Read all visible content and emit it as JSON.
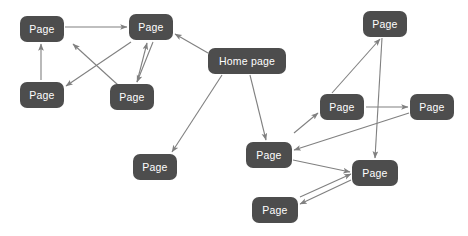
{
  "diagram": {
    "background_color": "#ffffff",
    "node_color": "#4d4d4d",
    "node_text_color": "#ffffff",
    "edge_color": "#808080",
    "width": 468,
    "height": 236,
    "nodes": [
      {
        "id": "n1",
        "label": "Page",
        "x": 20,
        "y": 16,
        "w": 44,
        "h": 26
      },
      {
        "id": "n2",
        "label": "Page",
        "x": 129,
        "y": 14,
        "w": 44,
        "h": 26
      },
      {
        "id": "n3",
        "label": "Page",
        "x": 20,
        "y": 82,
        "w": 44,
        "h": 26
      },
      {
        "id": "n4",
        "label": "Page",
        "x": 110,
        "y": 84,
        "w": 44,
        "h": 26
      },
      {
        "id": "n5",
        "label": "Home page",
        "x": 208,
        "y": 48,
        "w": 78,
        "h": 26
      },
      {
        "id": "n6",
        "label": "Page",
        "x": 133,
        "y": 154,
        "w": 44,
        "h": 26
      },
      {
        "id": "n7",
        "label": "Page",
        "x": 363,
        "y": 11,
        "w": 44,
        "h": 26
      },
      {
        "id": "n8",
        "label": "Page",
        "x": 320,
        "y": 94,
        "w": 44,
        "h": 26
      },
      {
        "id": "n9",
        "label": "Page",
        "x": 410,
        "y": 94,
        "w": 44,
        "h": 26
      },
      {
        "id": "n10",
        "label": "Page",
        "x": 246,
        "y": 142,
        "w": 46,
        "h": 26
      },
      {
        "id": "n11",
        "label": "Page",
        "x": 352,
        "y": 160,
        "w": 46,
        "h": 26
      },
      {
        "id": "n12",
        "label": "Page",
        "x": 252,
        "y": 197,
        "w": 46,
        "h": 26
      }
    ],
    "edges": [
      {
        "from": "n1",
        "to": "n2",
        "x1": 65,
        "y1": 27,
        "x2": 127,
        "y2": 27
      },
      {
        "from": "n3",
        "to": "n1",
        "x1": 41,
        "y1": 80,
        "x2": 41,
        "y2": 44
      },
      {
        "from": "n4",
        "to": "n2",
        "x1": 137,
        "y1": 82,
        "x2": 147,
        "y2": 43
      },
      {
        "from": "n2",
        "to": "n4",
        "x1": 153,
        "y1": 42,
        "x2": 137,
        "y2": 82
      },
      {
        "from": "n2",
        "to": "n3",
        "x1": 131,
        "y1": 42,
        "x2": 66,
        "y2": 86
      },
      {
        "from": "n4",
        "to": "n2",
        "x1": 118,
        "y1": 85,
        "x2": 73,
        "y2": 44
      },
      {
        "from": "n5",
        "to": "n2",
        "x1": 208,
        "y1": 53,
        "x2": 175,
        "y2": 34
      },
      {
        "from": "n5",
        "to": "n6",
        "x1": 222,
        "y1": 75,
        "x2": 172,
        "y2": 152
      },
      {
        "from": "n5",
        "to": "n10",
        "x1": 250,
        "y1": 75,
        "x2": 266,
        "y2": 140
      },
      {
        "from": "n8",
        "to": "n7",
        "x1": 332,
        "y1": 93,
        "x2": 380,
        "y2": 39
      },
      {
        "from": "n7",
        "to": "n11",
        "x1": 382,
        "y1": 38,
        "x2": 375,
        "y2": 158
      },
      {
        "from": "n8",
        "to": "n9",
        "x1": 366,
        "y1": 107,
        "x2": 408,
        "y2": 107
      },
      {
        "from": "n10",
        "to": "n8",
        "x1": 294,
        "y1": 133,
        "x2": 318,
        "y2": 113
      },
      {
        "from": "n9",
        "to": "n10",
        "x1": 409,
        "y1": 113,
        "x2": 294,
        "y2": 150
      },
      {
        "from": "n10",
        "to": "n11",
        "x1": 293,
        "y1": 160,
        "x2": 350,
        "y2": 172
      },
      {
        "from": "n11",
        "to": "n12",
        "x1": 351,
        "y1": 180,
        "x2": 300,
        "y2": 204
      },
      {
        "from": "n12",
        "to": "n11",
        "x1": 300,
        "y1": 197,
        "x2": 351,
        "y2": 174
      }
    ]
  }
}
